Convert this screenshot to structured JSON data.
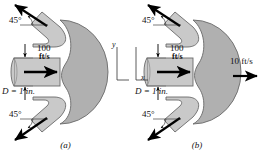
{
  "figure": {
    "colors": {
      "vane_body": "#b0b0b0",
      "vane_channel": "#c9c9c9",
      "outline": "#555555",
      "arrow": "#000000",
      "background": "#ffffff"
    }
  },
  "panels": [
    {
      "id": "a",
      "caption": "(a)",
      "description": "stationary vane",
      "labels": {
        "angle_top": "45°",
        "angle_bottom": "45°",
        "jet_speed_line1": "100",
        "jet_speed_line2": "ft/s",
        "diameter": "D = 1 in.",
        "axis_y": "y",
        "axis_x": "x"
      }
    },
    {
      "id": "b",
      "caption": "(b)",
      "description": "vane moving to the right",
      "labels": {
        "angle_top": "45°",
        "angle_bottom": "45°",
        "jet_speed_line1": "100",
        "jet_speed_line2": "ft/s",
        "diameter": "D = 1 in.",
        "vane_speed": "10 ft/s",
        "axis_y": "y",
        "axis_x": "x"
      }
    }
  ]
}
